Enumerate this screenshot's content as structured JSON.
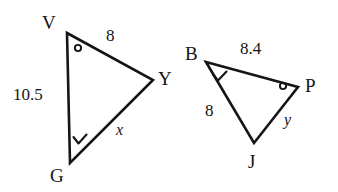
{
  "figure": {
    "kind": "similar-triangles-geometry-figure",
    "background_color": "#ffffff",
    "stroke_color": "#151515",
    "text_color": "#151515",
    "width": 338,
    "height": 192
  },
  "triangles": [
    {
      "name": "triangle-vyg",
      "vertices": [
        {
          "label": "V",
          "x": 67,
          "y": 33,
          "label_x": 42,
          "label_y": 13,
          "angle_mark": "circle-angle-mark"
        },
        {
          "label": "Y",
          "x": 153,
          "y": 80,
          "label_x": 158,
          "label_y": 69,
          "angle_mark": "none"
        },
        {
          "label": "G",
          "x": 70,
          "y": 163,
          "label_x": 50,
          "label_y": 166,
          "angle_mark": "check-angle-mark"
        }
      ],
      "sides": [
        {
          "name": "side-vy",
          "label": "8",
          "label_x": 106,
          "label_y": 27,
          "is_variable": false
        },
        {
          "name": "side-vg",
          "label": "10.5",
          "label_x": 13,
          "label_y": 86,
          "is_variable": false
        },
        {
          "name": "side-gy",
          "label": "x",
          "label_x": 116,
          "label_y": 122,
          "is_variable": true
        }
      ]
    },
    {
      "name": "triangle-bpj",
      "vertices": [
        {
          "label": "B",
          "x": 206,
          "y": 62,
          "label_x": 185,
          "label_y": 44,
          "angle_mark": "check-angle-mark"
        },
        {
          "label": "P",
          "x": 298,
          "y": 87,
          "label_x": 305,
          "label_y": 76,
          "angle_mark": "circle-angle-mark"
        },
        {
          "label": "J",
          "x": 254,
          "y": 143,
          "label_x": 248,
          "label_y": 152,
          "angle_mark": "none"
        }
      ],
      "sides": [
        {
          "name": "side-bp",
          "label": "8.4",
          "label_x": 240,
          "label_y": 40,
          "is_variable": false
        },
        {
          "name": "side-bj",
          "label": "8",
          "label_x": 205,
          "label_y": 102,
          "is_variable": false
        },
        {
          "name": "side-pj",
          "label": "y",
          "label_x": 284,
          "label_y": 112,
          "is_variable": true
        }
      ]
    }
  ],
  "angle_marks": [
    {
      "name": "angle-mark-v",
      "type": "circle",
      "cx": 78,
      "cy": 48,
      "r": 3.1
    },
    {
      "name": "angle-mark-g",
      "type": "check",
      "x": 80,
      "y": 140
    },
    {
      "name": "angle-mark-b",
      "type": "check",
      "x": 218,
      "y": 74
    },
    {
      "name": "angle-mark-p",
      "type": "circle",
      "cx": 283,
      "cy": 87,
      "r": 3.1
    }
  ]
}
